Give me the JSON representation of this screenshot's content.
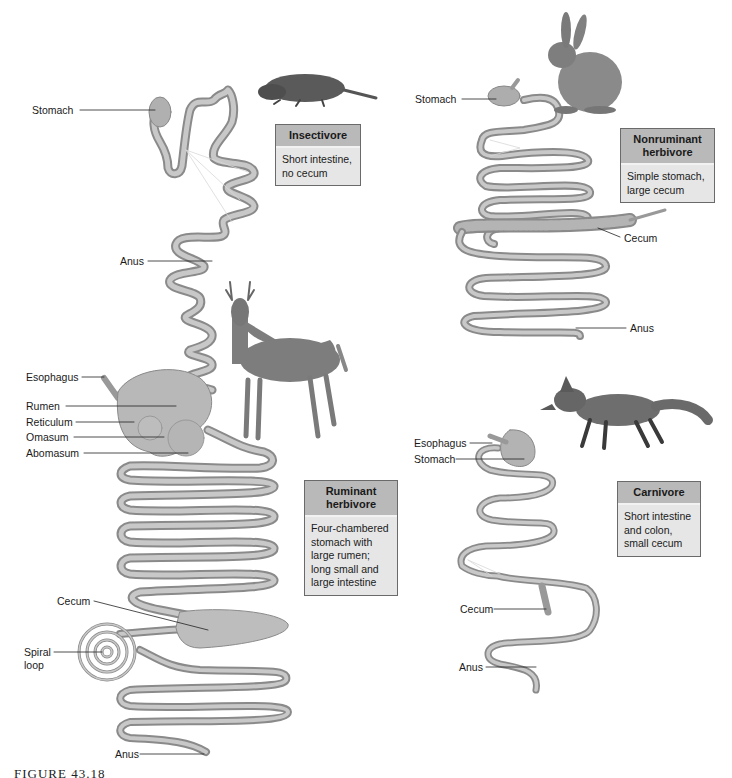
{
  "panels": {
    "insectivore": {
      "title": "Insectivore",
      "description": "Short intestine,\nno cecum",
      "animal": "mole",
      "labels": {
        "stomach": "Stomach",
        "anus": "Anus"
      }
    },
    "nonruminant": {
      "title": "Nonruminant\nherbivore",
      "description": "Simple stomach,\nlarge cecum",
      "animal": "rabbit",
      "labels": {
        "stomach": "Stomach",
        "cecum": "Cecum",
        "anus": "Anus"
      }
    },
    "ruminant": {
      "title": "Ruminant\nherbivore",
      "description": "Four-chambered\nstomach with\nlarge rumen;\nlong small and\nlarge intestine",
      "animal": "deer",
      "labels": {
        "esophagus": "Esophagus",
        "rumen": "Rumen",
        "reticulum": "Reticulum",
        "omasum": "Omasum",
        "abomasum": "Abomasum",
        "cecum": "Cecum",
        "spiral_loop": "Spiral\nloop",
        "anus": "Anus"
      }
    },
    "carnivore": {
      "title": "Carnivore",
      "description": "Short intestine\nand colon,\nsmall cecum",
      "animal": "fox",
      "labels": {
        "esophagus": "Esophagus",
        "stomach": "Stomach",
        "cecum": "Cecum",
        "anus": "Anus"
      }
    }
  },
  "caption": "FIGURE 43.18",
  "colors": {
    "gut": "#bdbdbd",
    "gut_edge": "#8a8a8a",
    "box_header": "#b9b9b9",
    "box_body": "#e6e6e6",
    "animal": "#7a7a7a"
  }
}
